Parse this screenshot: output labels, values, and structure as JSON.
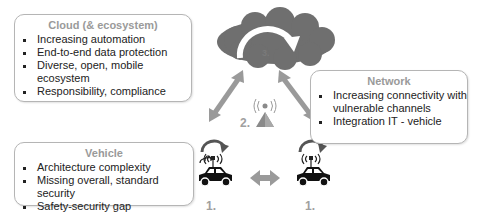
{
  "cloud_box": {
    "title": "Cloud (& ecosystem)",
    "items": [
      "Increasing automation",
      "End-to-end data protection",
      "Diverse, open, mobile ecosystem",
      "Responsibility, compliance"
    ]
  },
  "network_box": {
    "title": "Network",
    "items": [
      "Increasing connectivity with vulnerable channels",
      "Integration IT - vehicle"
    ]
  },
  "vehicle_box": {
    "title": "Vehicle",
    "items": [
      "Architecture complexity",
      "Missing overall, standard security",
      "Safety-security gap"
    ]
  },
  "labels": {
    "cloud_number": "3.",
    "tower_number": "2.",
    "car_left_number": "1.",
    "car_right_number": "1."
  },
  "colors": {
    "cloud": "#6f6f6f",
    "arrow": "#9a9a9a",
    "label": "#a0a0a0",
    "box_border": "#b5b5b5"
  }
}
